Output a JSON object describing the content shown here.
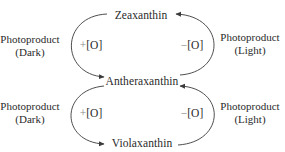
{
  "diagram": {
    "type": "xanthophyll-cycle",
    "nodes": {
      "top": "Zeaxanthin",
      "middle": "Antheraxanthin",
      "bottom": "Violaxanthin"
    },
    "upper_cycle": {
      "left_reaction": {
        "sign": "+",
        "label": "[O]"
      },
      "right_reaction": {
        "sign": "−",
        "label": "[O]"
      },
      "left_side_label": {
        "line1": "Photoproduct",
        "line2": "(Dark)"
      },
      "right_side_label": {
        "line1": "Photoproduct",
        "line2": "(Light)"
      }
    },
    "lower_cycle": {
      "left_reaction": {
        "sign": "+",
        "label": "[O]"
      },
      "right_reaction": {
        "sign": "−",
        "label": "[O]"
      },
      "left_side_label": {
        "line1": "Photoproduct",
        "line2": "(Dark)"
      },
      "right_side_label": {
        "line1": "Photoproduct",
        "line2": "(Light)"
      }
    },
    "edges": [
      {
        "from": "Zeaxanthin",
        "to": "Antheraxanthin",
        "side": "left",
        "reaction": "+[O]",
        "condition": "Dark"
      },
      {
        "from": "Antheraxanthin",
        "to": "Zeaxanthin",
        "side": "right",
        "reaction": "−[O]",
        "condition": "Light"
      },
      {
        "from": "Antheraxanthin",
        "to": "Violaxanthin",
        "side": "left",
        "reaction": "+[O]",
        "condition": "Dark"
      },
      {
        "from": "Violaxanthin",
        "to": "Antheraxanthin",
        "side": "right",
        "reaction": "−[O]",
        "condition": "Light"
      }
    ],
    "colors": {
      "line": "#3a3a3a",
      "text": "#2a2a2a",
      "sign": "#888888"
    }
  }
}
